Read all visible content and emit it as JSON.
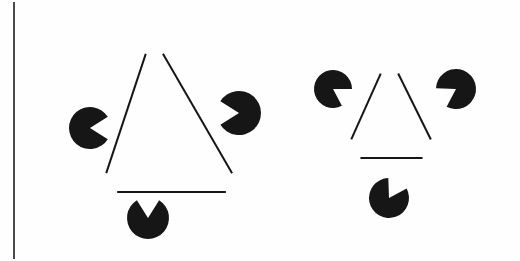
{
  "page": {
    "title": "Kanizsa Triangle Illusion Figures",
    "background_color": "#fefefe",
    "ink_color": "#161616",
    "width": 520,
    "height": 261
  },
  "margin_rule": {
    "name": "left-margin-rule",
    "orientation": "vertical",
    "x": 14,
    "y1": 2,
    "y2": 259,
    "stroke_width": 2,
    "color": "#4a4a4a"
  },
  "figures": [
    {
      "id": "figure-left",
      "label": "Kanizsa figure left",
      "caption": "",
      "triangle": {
        "name": "outlined-triangle",
        "orientation": "point-up",
        "stroke_width": 2,
        "color": "#161616",
        "vertices": [
          {
            "name": "apex",
            "x": 152,
            "y": 35
          },
          {
            "name": "bottom-left",
            "x": 100,
            "y": 192
          },
          {
            "name": "bottom-right",
            "x": 243,
            "y": 192
          }
        ],
        "gap_fraction": 0.12,
        "note": "edges are interrupted near each vertex leaving illusory gaps"
      },
      "discs": [
        {
          "name": "pacman-left",
          "cx": 90,
          "cy": 128,
          "r": 21,
          "wedge_start_deg": -32,
          "wedge_end_deg": 32,
          "opening_direction": "right",
          "color": "#161616"
        },
        {
          "name": "pacman-right",
          "cx": 239,
          "cy": 113,
          "r": 22,
          "wedge_start_deg": 148,
          "wedge_end_deg": 212,
          "opening_direction": "left",
          "color": "#161616"
        },
        {
          "name": "pacman-bottom",
          "cx": 148,
          "cy": 218,
          "r": 21,
          "wedge_start_deg": 238,
          "wedge_end_deg": 302,
          "opening_direction": "up",
          "color": "#161616"
        }
      ]
    },
    {
      "id": "figure-right",
      "label": "Kanizsa figure right",
      "caption": "",
      "triangle": {
        "name": "outlined-triangle",
        "orientation": "point-up",
        "stroke_width": 2,
        "color": "#161616",
        "vertices": [
          {
            "name": "apex",
            "x": 389,
            "y": 55
          },
          {
            "name": "bottom-left",
            "x": 343,
            "y": 158
          },
          {
            "name": "bottom-right",
            "x": 440,
            "y": 158
          }
        ],
        "gap_fraction": 0.18,
        "note": "edges are interrupted near each vertex leaving illusory gaps"
      },
      "discs": [
        {
          "name": "pacman-top-left",
          "cx": 333,
          "cy": 89,
          "r": 19,
          "wedge_start_deg": 0,
          "wedge_end_deg": 62,
          "opening_direction": "down-right",
          "color": "#161616"
        },
        {
          "name": "pacman-top-right",
          "cx": 456,
          "cy": 89,
          "r": 20,
          "wedge_start_deg": 118,
          "wedge_end_deg": 182,
          "opening_direction": "down-left",
          "color": "#161616"
        },
        {
          "name": "pacman-bottom",
          "cx": 389,
          "cy": 198,
          "r": 20,
          "wedge_start_deg": 268,
          "wedge_end_deg": 332,
          "opening_direction": "up-right",
          "color": "#161616"
        }
      ]
    }
  ]
}
